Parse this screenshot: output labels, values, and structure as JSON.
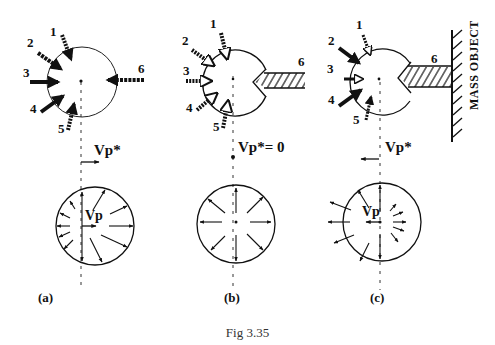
{
  "caption": "Fig 3.35",
  "panels": [
    {
      "id": "a",
      "sublabel": "(a)",
      "forces": [
        "1",
        "2",
        "3",
        "4",
        "5",
        "6"
      ],
      "velocity_label": "Vp*",
      "velocity_direction": "right",
      "bottom_label": "Vp",
      "description": "Free particle acted on by forces 1-6; net velocity Vp* to the right"
    },
    {
      "id": "b",
      "sublabel": "(b)",
      "forces": [
        "1",
        "2",
        "3",
        "4",
        "5",
        "6"
      ],
      "velocity_label": "Vp*= 0",
      "velocity_direction": "none",
      "bottom_label": "",
      "description": "Force 6 replaced by a rigid rod; net velocity zero, symmetric radial expansion"
    },
    {
      "id": "c",
      "sublabel": "(c)",
      "forces": [
        "1",
        "2",
        "3",
        "4",
        "5",
        "6"
      ],
      "velocity_label": "Vp*",
      "velocity_direction": "left",
      "bottom_label": "Vp",
      "wall_label": "MASS OBJECT",
      "description": "Rod 6 attached to a mass object; net velocity Vp* to the left"
    }
  ],
  "colors": {
    "ink": "#111111",
    "background": "#ffffff",
    "caption": "#333333"
  }
}
